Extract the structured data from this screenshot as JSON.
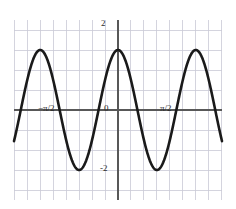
{
  "figure": {
    "kind": "cartesian-plot",
    "background_color": "#ffffff",
    "width": 236,
    "height": 209
  },
  "style": {
    "grid_color": "#c9c9d6",
    "axis_color": "#585858",
    "curve_color": "#1a1a1a",
    "label_color": "#2b2b2b",
    "curve_width": 2.6,
    "axis_width": 1.4,
    "grid_width": 0.8
  },
  "axes": {
    "x_axis_label": "",
    "y_axis_label": "",
    "origin_label": "0",
    "x_tick_labels": [
      "−π/2",
      "0",
      "π/2"
    ],
    "y_tick_labels": [
      "2",
      "-2"
    ],
    "grid_visible": true,
    "x_range_units": [
      -4.2,
      4.2
    ],
    "y_range_units": [
      -3.0,
      3.0
    ],
    "x_gridline_step_units": 0.5235987755982988,
    "y_gridline_step_units": 0.6666666666666666
  },
  "chart_data": {
    "type": "line",
    "title": "",
    "subtitle": "",
    "xlabel": "",
    "ylabel": "",
    "function": "y = 2*cos(2x)",
    "amplitude": 2,
    "period": 3.141592653589793,
    "xlim": [
      -4.2,
      4.2
    ],
    "ylim": [
      -3.0,
      3.0
    ],
    "grid": true,
    "legend": "none",
    "xticks": [
      -1.5707963267948966,
      0,
      1.5707963267948966
    ],
    "xticklabels": [
      "−π/2",
      "0",
      "π/2"
    ],
    "yticks": [
      2,
      -2
    ],
    "yticklabels": [
      "2",
      "-2"
    ],
    "annotations": [],
    "series": [
      {
        "name": "y = 2cos(2x)",
        "color": "#1a1a1a",
        "key_points": [
          {
            "label": "peak-left-outer",
            "x": -3.141592653589793,
            "y": 2
          },
          {
            "label": "zero",
            "x": -2.356194490192345,
            "y": 0
          },
          {
            "label": "trough-left",
            "x": -1.5707963267948966,
            "y": -2
          },
          {
            "label": "zero",
            "x": -0.7853981633974483,
            "y": 0
          },
          {
            "label": "peak-center",
            "x": 0,
            "y": 2
          },
          {
            "label": "zero",
            "x": 0.7853981633974483,
            "y": 0
          },
          {
            "label": "trough-right",
            "x": 1.5707963267948966,
            "y": -2
          },
          {
            "label": "zero",
            "x": 2.356194490192345,
            "y": 0
          },
          {
            "label": "peak-right-outer",
            "x": 3.141592653589793,
            "y": 2
          }
        ]
      }
    ]
  }
}
